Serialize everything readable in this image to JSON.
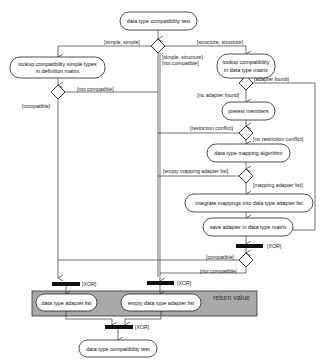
{
  "diagram": {
    "type": "UML activity diagram",
    "start_node": "data type compatibility test",
    "end_node": "data type compatibility test",
    "nodes": {
      "lookup_simple_line1": "lookup compatibility simple types",
      "lookup_simple_line2": "in definition matrix",
      "lookup_matrix_line1": "lookup compatibility",
      "lookup_matrix_line2": "in data type matrix",
      "pretest": "pretest members",
      "mapping_algorithm": "data type mapping algorithm",
      "integrate": "integrate mappings into data type adapter list",
      "save_adapter": "save adapter in data type matrix",
      "adapter_list": "data type adapter list",
      "empty_adapter_list": "empty data type adapter list"
    },
    "guards": {
      "simple_simple": "[simple, simple]",
      "structure_structure": "[structure, structure]",
      "simple_structure": "[simple, structure]",
      "not_compatible_1": "[not compatible]",
      "not_compatible_2": "[not compatible]",
      "compatible_left": "[compatible]",
      "adapter_found": "[adapter found]",
      "no_adapter_found": "[no adapter found]",
      "restriction_conflict": "[restriction conflict]",
      "no_restriction_conflict": "[no restriction conflict]",
      "empty_mapping_adapter_list": "[empty mapping adapter list]",
      "mapping_adapter_list": "[mapping adapter list]",
      "compatible_right": "[compatible]",
      "not_compatible_right": "[not compatible]"
    },
    "sync_bars": {
      "xor_right": "[XOR]",
      "xor_left": "[XOR]",
      "xor_middle": "[XOR]",
      "xor_bottom": "[XOR]"
    },
    "partition": {
      "label": "return value",
      "fill": "#a9a9a9"
    }
  }
}
